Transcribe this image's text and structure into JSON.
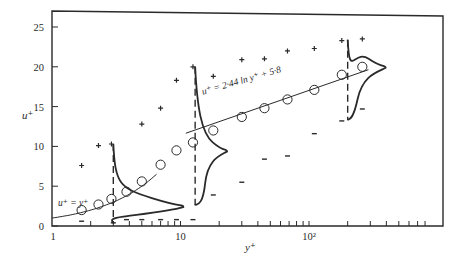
{
  "chart_data": {
    "type": "scatter",
    "title": "",
    "xlabel": "y⁺",
    "ylabel": "u⁺",
    "xscale": "log",
    "xlim": [
      1,
      800
    ],
    "ylim": [
      0,
      27
    ],
    "grid": false,
    "x_tick_labels": [
      "1",
      "10",
      "10²"
    ],
    "x_ticks": [
      1,
      10,
      100
    ],
    "y_tick_labels": [
      "0",
      "5",
      "10",
      "15",
      "20",
      "25"
    ],
    "y_ticks": [
      0,
      5,
      10,
      15,
      20,
      25
    ],
    "annotations": [
      {
        "text": "u⁺ = y⁺",
        "x": 2.0,
        "y": 4.3
      },
      {
        "text": "u⁺ = 2·44 ln y⁺ + 5·8",
        "x": 40,
        "y": 16.5
      }
    ],
    "series": [
      {
        "name": "mean velocity (circles)",
        "marker": "circle",
        "x": [
          1.7,
          2.3,
          2.9,
          3.8,
          5.0,
          7.0,
          9.3,
          12.5,
          18,
          30,
          45,
          68,
          110,
          180,
          260
        ],
        "y": [
          2.0,
          2.7,
          3.4,
          4.3,
          5.6,
          7.7,
          9.5,
          10.5,
          12.0,
          13.7,
          14.8,
          15.9,
          17.1,
          19.0,
          20.0
        ]
      },
      {
        "name": "maximum (plus)",
        "marker": "plus",
        "x": [
          1.7,
          2.3,
          2.9,
          5.0,
          7.0,
          9.3,
          12.5,
          18,
          30,
          45,
          68,
          110,
          180,
          260
        ],
        "y": [
          7.6,
          10.1,
          10.3,
          12.8,
          14.8,
          18.3,
          20.0,
          18.8,
          20.9,
          21.0,
          22.0,
          22.3,
          23.3,
          23.5
        ]
      },
      {
        "name": "minimum (minus)",
        "marker": "minus",
        "x": [
          1.7,
          3.0,
          3.8,
          5.0,
          7.0,
          9.3,
          12.5,
          18,
          30,
          45,
          68,
          110,
          180,
          260
        ],
        "y": [
          0.6,
          0.4,
          0.8,
          0.8,
          0.8,
          0.8,
          0.8,
          3.9,
          5.5,
          8.4,
          8.8,
          11.6,
          13.2,
          14.7
        ]
      },
      {
        "name": "viscous sublayer line u⁺ = y⁺",
        "type": "line",
        "x": [
          1,
          2,
          3,
          4,
          6
        ],
        "y": [
          1.0,
          2.0,
          3.0,
          4.0,
          6.0
        ]
      },
      {
        "name": "log law u⁺ = 2.44 ln y⁺ + 5.8",
        "type": "line",
        "x": [
          11,
          30,
          100,
          300
        ],
        "y": [
          11.65,
          14.1,
          17.0,
          19.7
        ]
      }
    ],
    "pdf_profiles": [
      {
        "y_plus": 3,
        "u_range": [
          0.3,
          10.3
        ],
        "peak_u": 2.5
      },
      {
        "y_plus": 13,
        "u_range": [
          2.6,
          20.0
        ],
        "peak_u": 9.5
      },
      {
        "y_plus": 200,
        "u_range": [
          13.3,
          23.4
        ],
        "peak_u": 20.0
      }
    ]
  }
}
